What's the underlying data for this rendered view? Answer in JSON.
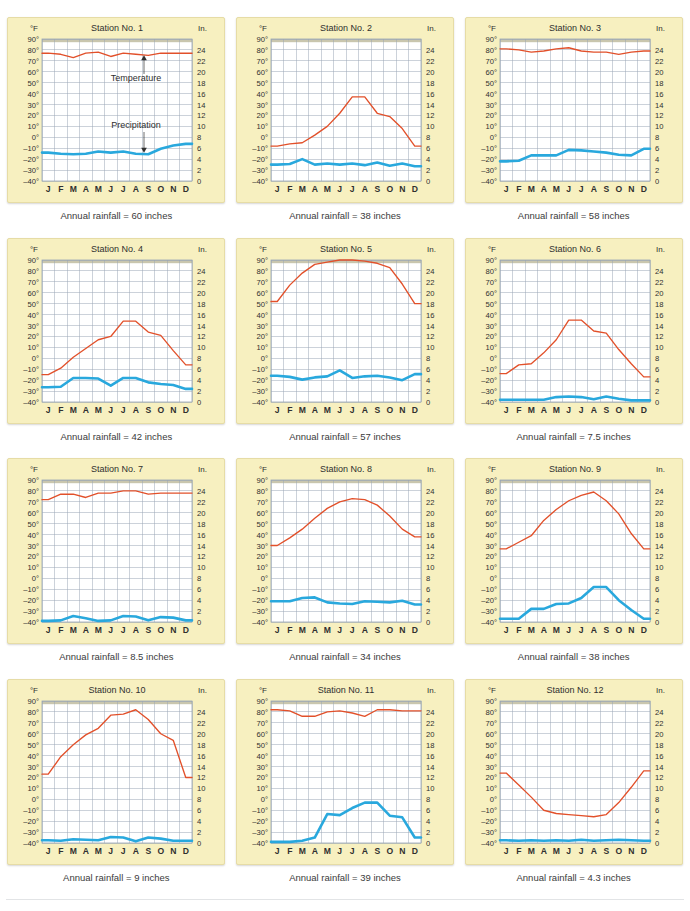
{
  "figure": {
    "top_caption": "",
    "bottom_caption": ""
  },
  "axes": {
    "left_unit_label": "°F",
    "right_unit_label": "In.",
    "temp_ticks": [
      "90°",
      "80°",
      "70°",
      "60°",
      "50°",
      "40°",
      "30°",
      "20°",
      "10°",
      "0°",
      "–10°",
      "–20°",
      "–30°",
      "–40°"
    ],
    "temp_tick_values": [
      90,
      80,
      70,
      60,
      50,
      40,
      30,
      20,
      10,
      0,
      -10,
      -20,
      -30,
      -40
    ],
    "precip_ticks": [
      "24",
      "22",
      "20",
      "18",
      "16",
      "14",
      "12",
      "10",
      "8",
      "6",
      "4",
      "2",
      "0"
    ],
    "precip_tick_values": [
      24,
      22,
      20,
      18,
      16,
      14,
      12,
      10,
      8,
      6,
      4,
      2,
      0
    ],
    "months": [
      "J",
      "F",
      "M",
      "A",
      "M",
      "J",
      "J",
      "A",
      "S",
      "O",
      "N",
      "D"
    ],
    "temp_range": [
      -40,
      90
    ],
    "precip_range": [
      0,
      26
    ]
  },
  "colors": {
    "temperature_line": "#e2502a",
    "precipitation_line": "#29a8dd",
    "panel_background": "#f7f0c0",
    "panel_border": "#e6dca6",
    "plot_background": "#ffffff",
    "grid_line": "#9aa5b5",
    "axis_text": "#2f2f2f",
    "top_band": "#c9c6ae"
  },
  "annotations": {
    "temperature_label": "Temperature",
    "precipitation_label": "Precipitation"
  },
  "chart_data": {
    "type": "line",
    "xlabel": "",
    "ylabel": "Temperature (°F) / Precipitation (In.)",
    "categories": [
      "J",
      "F",
      "M",
      "A",
      "M",
      "J",
      "J",
      "A",
      "S",
      "O",
      "N",
      "D"
    ],
    "panels": [
      {
        "id": 1,
        "title": "Station No. 1",
        "rainfall_label": "Annual rainfall = 60 inches",
        "annual_rainfall_inches": 60,
        "has_annotations": true,
        "series": [
          {
            "name": "Temperature",
            "unit": "°F",
            "values": [
              77,
              76,
              73,
              77,
              78,
              74,
              77,
              76,
              75,
              77,
              77,
              77
            ]
          },
          {
            "name": "Precipitation",
            "unit": "in",
            "values": [
              5.2,
              5.0,
              4.9,
              5.0,
              5.4,
              5.2,
              5.4,
              5.0,
              4.9,
              5.9,
              6.5,
              6.8
            ]
          }
        ]
      },
      {
        "id": 2,
        "title": "Station No. 2",
        "rainfall_label": "Annual rainfall = 38 inches",
        "annual_rainfall_inches": 38,
        "has_annotations": false,
        "series": [
          {
            "name": "Temperature",
            "unit": "°F",
            "values": [
              -8,
              -6,
              -5,
              2,
              10,
              22,
              37,
              37,
              22,
              19,
              8,
              -8
            ]
          },
          {
            "name": "Precipitation",
            "unit": "in",
            "values": [
              3.0,
              3.1,
              4.0,
              3.0,
              3.2,
              3.0,
              3.2,
              2.9,
              3.4,
              2.8,
              3.2,
              2.7
            ]
          }
        ]
      },
      {
        "id": 3,
        "title": "Station No. 3",
        "rainfall_label": "Annual rainfall = 58 inches",
        "annual_rainfall_inches": 58,
        "has_annotations": false,
        "series": [
          {
            "name": "Temperature",
            "unit": "°F",
            "values": [
              81,
              80,
              78,
              79,
              81,
              82,
              79,
              78,
              78,
              76,
              78,
              79
            ]
          },
          {
            "name": "Precipitation",
            "unit": "in",
            "values": [
              3.6,
              3.7,
              4.7,
              4.7,
              4.7,
              5.7,
              5.6,
              5.4,
              5.2,
              4.8,
              4.7,
              5.9
            ]
          }
        ]
      },
      {
        "id": 4,
        "title": "Station No. 4",
        "rainfall_label": "Annual rainfall = 42 inches",
        "annual_rainfall_inches": 42,
        "has_annotations": false,
        "series": [
          {
            "name": "Temperature",
            "unit": "°F",
            "values": [
              -15,
              -9,
              1,
              9,
              17,
              20,
              34,
              34,
              24,
              21,
              7,
              -6
            ]
          },
          {
            "name": "Precipitation",
            "unit": "in",
            "values": [
              2.7,
              2.8,
              4.4,
              4.4,
              4.3,
              3.0,
              4.4,
              4.4,
              3.6,
              3.3,
              3.1,
              2.4
            ]
          }
        ]
      },
      {
        "id": 5,
        "title": "Station No. 5",
        "rainfall_label": "Annual rainfall = 57 inches",
        "annual_rainfall_inches": 57,
        "has_annotations": false,
        "series": [
          {
            "name": "Temperature",
            "unit": "°F",
            "values": [
              52,
              67,
              78,
              86,
              88,
              90,
              90,
              89,
              87,
              83,
              68,
              50
            ]
          },
          {
            "name": "Precipitation",
            "unit": "in",
            "values": [
              4.8,
              4.6,
              4.1,
              4.5,
              4.7,
              5.8,
              4.4,
              4.7,
              4.8,
              4.5,
              4.0,
              5.1
            ]
          }
        ]
      },
      {
        "id": 6,
        "title": "Station No. 6",
        "rainfall_label": "Annual rainfall = 7.5 inches",
        "annual_rainfall_inches": 7.5,
        "has_annotations": false,
        "series": [
          {
            "name": "Temperature",
            "unit": "°F",
            "values": [
              -14,
              -6,
              -5,
              5,
              17,
              35,
              35,
              25,
              23,
              8,
              -5,
              -17
            ]
          },
          {
            "name": "Precipitation",
            "unit": "in",
            "values": [
              0.4,
              0.4,
              0.4,
              0.4,
              0.9,
              1.0,
              0.9,
              0.5,
              1.0,
              0.6,
              0.3,
              0.3
            ]
          }
        ]
      },
      {
        "id": 7,
        "title": "Station No. 7",
        "rainfall_label": "Annual rainfall = 8.5 inches",
        "annual_rainfall_inches": 8.5,
        "has_annotations": false,
        "series": [
          {
            "name": "Temperature",
            "unit": "°F",
            "values": [
              72,
              77,
              77,
              74,
              78,
              78,
              80,
              80,
              77,
              78,
              78,
              78
            ]
          },
          {
            "name": "Precipitation",
            "unit": "in",
            "values": [
              0.2,
              0.3,
              1.1,
              0.7,
              0.2,
              0.3,
              1.1,
              1.0,
              0.3,
              0.9,
              0.8,
              0.3
            ]
          }
        ]
      },
      {
        "id": 8,
        "title": "Station No. 8",
        "rainfall_label": "Annual rainfall = 34 inches",
        "annual_rainfall_inches": 34,
        "has_annotations": false,
        "series": [
          {
            "name": "Temperature",
            "unit": "°F",
            "values": [
              30,
              37,
              45,
              55,
              64,
              70,
              73,
              72,
              67,
              57,
              45,
              38
            ]
          },
          {
            "name": "Precipitation",
            "unit": "in",
            "values": [
              3.8,
              3.8,
              4.4,
              4.5,
              3.6,
              3.4,
              3.3,
              3.8,
              3.7,
              3.6,
              3.9,
              3.2
            ]
          }
        ]
      },
      {
        "id": 9,
        "title": "Station No. 9",
        "rainfall_label": "Annual rainfall = 38 inches",
        "annual_rainfall_inches": 38,
        "has_annotations": false,
        "series": [
          {
            "name": "Temperature",
            "unit": "°F",
            "values": [
              27,
              33,
              39,
              53,
              63,
              71,
              76,
              79,
              71,
              59,
              41,
              27
            ]
          },
          {
            "name": "Precipitation",
            "unit": "in",
            "values": [
              0.6,
              0.6,
              2.4,
              2.4,
              3.3,
              3.4,
              4.4,
              6.4,
              6.4,
              4.0,
              2.2,
              0.6
            ]
          }
        ]
      },
      {
        "id": 10,
        "title": "Station No. 10",
        "rainfall_label": "Annual rainfall = 9 inches",
        "annual_rainfall_inches": 9,
        "has_annotations": false,
        "series": [
          {
            "name": "Temperature",
            "unit": "°F",
            "values": [
              23,
              39,
              50,
              59,
              65,
              77,
              78,
              82,
              73,
              60,
              54,
              20
            ]
          },
          {
            "name": "Precipitation",
            "unit": "in",
            "values": [
              0.5,
              0.4,
              0.7,
              0.6,
              0.5,
              1.1,
              1.0,
              0.3,
              1.0,
              0.8,
              0.4,
              0.4
            ]
          }
        ]
      },
      {
        "id": 11,
        "title": "Station No. 11",
        "rainfall_label": "Annual rainfall = 39 inches",
        "annual_rainfall_inches": 39,
        "has_annotations": false,
        "series": [
          {
            "name": "Temperature",
            "unit": "°F",
            "values": [
              82,
              81,
              76,
              76,
              80,
              81,
              79,
              76,
              82,
              82,
              81,
              81
            ]
          },
          {
            "name": "Precipitation",
            "unit": "in",
            "values": [
              0.2,
              0.2,
              0.4,
              1.0,
              5.3,
              5.1,
              6.4,
              7.4,
              7.4,
              5.0,
              4.7,
              1.0
            ]
          }
        ]
      },
      {
        "id": 12,
        "title": "Station No. 12",
        "rainfall_label": "Annual rainfall = 4.3 inches",
        "annual_rainfall_inches": 4.3,
        "has_annotations": false,
        "series": [
          {
            "name": "Temperature",
            "unit": "°F",
            "values": [
              24,
              13,
              2,
              -10,
              -13,
              -14,
              -15,
              -16,
              -14,
              -3,
              11,
              26
            ]
          },
          {
            "name": "Precipitation",
            "unit": "in",
            "values": [
              0.5,
              0.4,
              0.5,
              0.4,
              0.5,
              0.4,
              0.6,
              0.4,
              0.5,
              0.6,
              0.5,
              0.4
            ]
          }
        ]
      }
    ]
  }
}
